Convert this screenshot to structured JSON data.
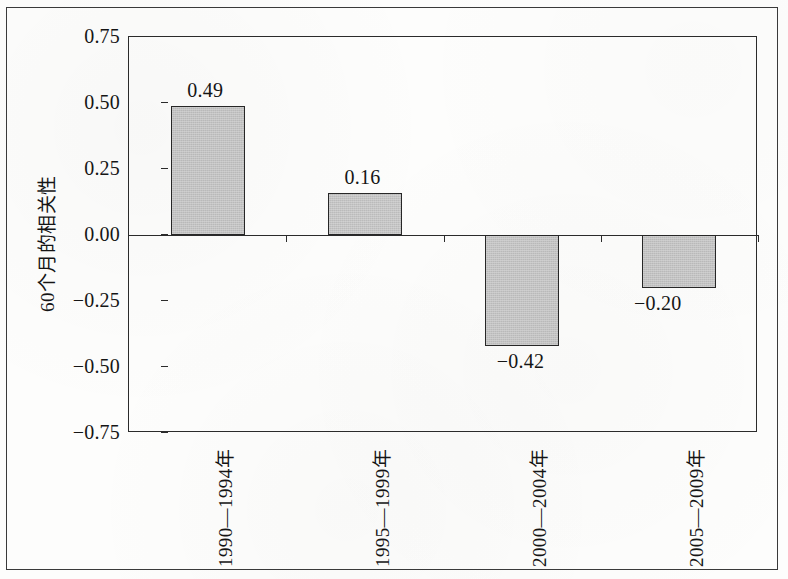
{
  "chart_data": {
    "type": "bar",
    "title": "",
    "xlabel": "",
    "ylabel": "60个月的相关性",
    "categories": [
      "1990—1994年",
      "1995—1999年",
      "2000—2004年",
      "2005—2009年"
    ],
    "values": [
      0.49,
      0.16,
      -0.42,
      -0.2
    ],
    "value_labels": [
      "0.49",
      "0.16",
      "−0.42",
      "−0.20"
    ],
    "ylim": [
      -0.75,
      0.75
    ],
    "ytick_values": [
      0.75,
      0.5,
      0.25,
      0.0,
      -0.25,
      -0.5,
      -0.75
    ],
    "ytick_labels": [
      "0.75",
      "0.50",
      "0.25",
      "0.00",
      "−0.25",
      "−0.50",
      "−0.75"
    ],
    "grid": false,
    "legend": null,
    "series": [
      {
        "name": "60个月的相关性",
        "values": [
          0.49,
          0.16,
          -0.42,
          -0.2
        ]
      }
    ],
    "bar_fill_color": "#c2c2c2",
    "bar_border_color": "#272727",
    "axis_color": "#2b2b2b",
    "background_color": "#fdfdfc"
  }
}
